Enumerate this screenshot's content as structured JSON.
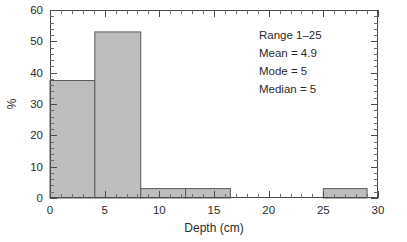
{
  "chart_data": {
    "type": "bar",
    "title": "",
    "subtitle": "",
    "xlabel": "Depth (cm)",
    "ylabel": "%",
    "xlim": [
      0,
      30
    ],
    "ylim": [
      0,
      60
    ],
    "grid": false,
    "legend": null,
    "x_ticks": [
      0,
      5,
      10,
      15,
      20,
      25,
      30
    ],
    "x_tick_labels": [
      "0",
      "5",
      "10",
      "15",
      "20",
      "25",
      "30"
    ],
    "x_minor_tick_step": 1,
    "y_ticks": [
      0,
      10,
      20,
      30,
      40,
      50,
      60
    ],
    "y_tick_labels": [
      "0",
      "10",
      "20",
      "30",
      "40",
      "50",
      "60"
    ],
    "y_minor_tick_step": 2,
    "bars": [
      {
        "x_start": 0.0,
        "x_end": 4.1,
        "value": 37.5
      },
      {
        "x_start": 4.1,
        "x_end": 8.3,
        "value": 53.0
      },
      {
        "x_start": 8.3,
        "x_end": 12.4,
        "value": 3.0
      },
      {
        "x_start": 12.4,
        "x_end": 16.5,
        "value": 3.0
      },
      {
        "x_start": 25.0,
        "x_end": 29.0,
        "value": 3.0
      }
    ],
    "bar_fill_color": "#bdbdbd",
    "bar_edge_color": "#5a5a5a",
    "annotations": [
      "Range 1–25",
      "Mean = 4.9",
      "Mode = 5",
      "Median = 5"
    ]
  },
  "stats_box": {
    "range_label": "Range 1–25",
    "mean_label": "Mean = 4.9",
    "mode_label": "Mode = 5",
    "median_label": "Median = 5"
  },
  "axes": {
    "x_title": "Depth (cm)",
    "y_title": "%"
  }
}
